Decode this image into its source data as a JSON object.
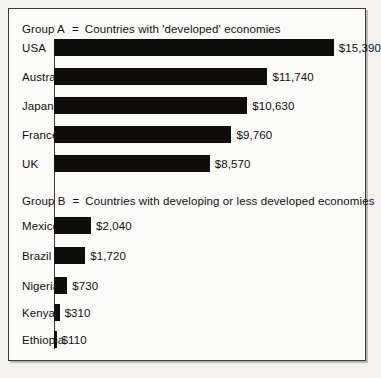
{
  "figure": {
    "background_color": "#fbfbfa",
    "border_color": "#3a3a3a",
    "bar_color": "#100d0c",
    "text_color": "#14100e"
  },
  "groups": [
    {
      "name": "Group A",
      "equals": "=",
      "description": "Countries with 'developed' economies"
    },
    {
      "name": "Group B",
      "equals": "=",
      "description": "Countries with developing or less developed economies"
    }
  ],
  "chart_data": {
    "type": "bar",
    "orientation": "horizontal",
    "title": "",
    "subtitle": "",
    "xlabel": "",
    "ylabel": "",
    "xlim": [
      0,
      17000
    ],
    "grid": false,
    "legend": false,
    "value_prefix": "$",
    "categories": [
      "USA",
      "Australia",
      "Japan",
      "France",
      "UK",
      "Mexico",
      "Brazil",
      "Nigeria",
      "Kenya",
      "Ethiopia"
    ],
    "values": [
      15390,
      11740,
      10630,
      9760,
      8570,
      2040,
      1720,
      730,
      310,
      110
    ],
    "value_labels": [
      "$15,390",
      "$11,740",
      "$10,630",
      "$9,760",
      "$8,570",
      "$2,040",
      "$1,720",
      "$730",
      "$310",
      "$110"
    ],
    "group_of_category": [
      "Group A",
      "Group A",
      "Group A",
      "Group A",
      "Group A",
      "Group B",
      "Group B",
      "Group B",
      "Group B",
      "Group B"
    ],
    "series": [
      {
        "name": "GNP per head",
        "values": [
          15390,
          11740,
          10630,
          9760,
          8570,
          2040,
          1720,
          730,
          310,
          110
        ]
      }
    ]
  }
}
